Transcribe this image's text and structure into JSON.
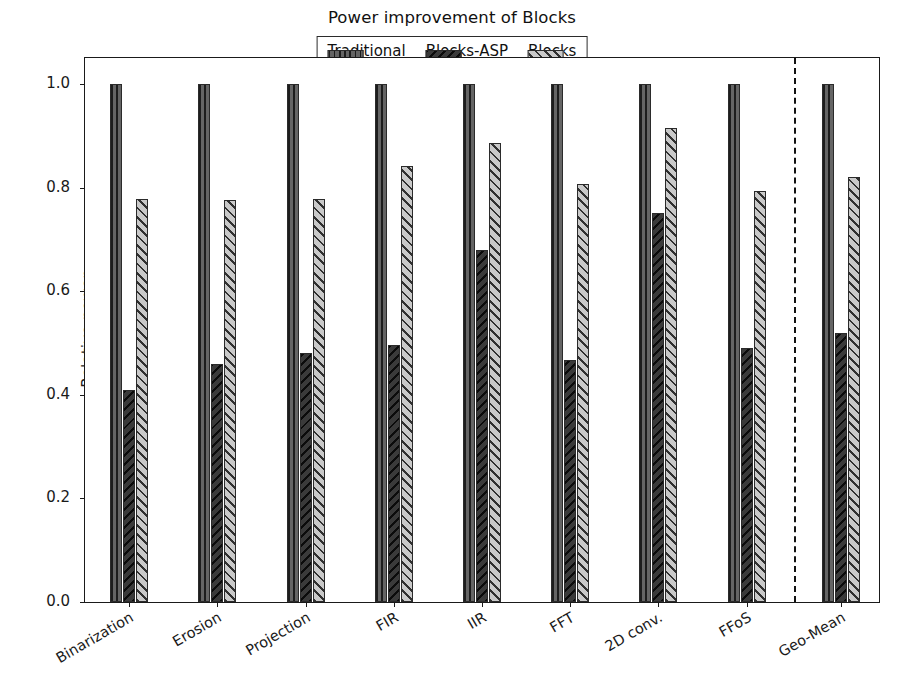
{
  "chart_data": {
    "type": "bar",
    "title": "Power improvement of Blocks",
    "xlabel": "",
    "ylabel": "Relative power",
    "ylim": [
      0.0,
      1.05
    ],
    "yticks": [
      "0.0",
      "0.2",
      "0.4",
      "0.6",
      "0.8",
      "1.0"
    ],
    "ytick_values": [
      0.0,
      0.2,
      0.4,
      0.6,
      0.8,
      1.0
    ],
    "grid": false,
    "legend_position": "upper center",
    "categories": [
      "Binarization",
      "Erosion",
      "Projection",
      "FIR",
      "IIR",
      "FFT",
      "2D conv.",
      "FFoS",
      "Geo-Mean"
    ],
    "series": [
      {
        "name": "Traditional",
        "pattern": "vertical-hatch",
        "color": "#656565",
        "values": [
          1.0,
          1.0,
          1.0,
          1.0,
          1.0,
          1.0,
          1.0,
          1.0,
          1.0
        ]
      },
      {
        "name": "Blocks-ASP",
        "pattern": "backslash-hatch",
        "color": "#3a3a3a",
        "values": [
          0.41,
          0.46,
          0.48,
          0.497,
          0.68,
          0.467,
          0.75,
          0.491,
          0.52
        ]
      },
      {
        "name": "Blocks",
        "pattern": "forwardslash-hatch",
        "color": "#c9c9c9",
        "values": [
          0.778,
          0.775,
          0.777,
          0.842,
          0.886,
          0.806,
          0.915,
          0.794,
          0.82
        ]
      }
    ],
    "annotations": [
      {
        "type": "vertical-dashed-line",
        "after_category": "FFoS",
        "note": "separates per-benchmark results from the Geo-Mean summary"
      }
    ]
  },
  "legend": {
    "entries": [
      {
        "label": "Traditional"
      },
      {
        "label": "Blocks-ASP"
      },
      {
        "label": "Blocks"
      }
    ]
  }
}
